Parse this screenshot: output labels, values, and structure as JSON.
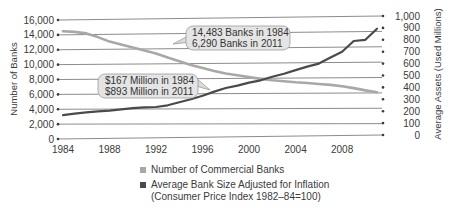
{
  "chart_data": {
    "type": "line",
    "title": "",
    "xlabel": "",
    "ylabel": "Number of Banks",
    "y2label": "Average Assets (Used Millions)",
    "x_ticks": [
      "1984",
      "1988",
      "1992",
      "1996",
      "2000",
      "2004",
      "2008"
    ],
    "y_ticks": [
      "0",
      "2,000",
      "4,000",
      "6,000",
      "8,000",
      "10,000",
      "12,000",
      "14,000",
      "16,000"
    ],
    "y2_ticks": [
      "0",
      "100",
      "200",
      "300",
      "400",
      "500",
      "600",
      "700",
      "800",
      "900",
      "1,000"
    ],
    "ylim": [
      0,
      16000
    ],
    "y2lim": [
      0,
      1000
    ],
    "xlim": [
      1984,
      2011
    ],
    "grid": true,
    "legend_position": "bottom",
    "x": [
      1984,
      1985,
      1986,
      1987,
      1988,
      1989,
      1990,
      1991,
      1992,
      1993,
      1994,
      1995,
      1996,
      1997,
      1998,
      1999,
      2000,
      2001,
      2002,
      2003,
      2004,
      2005,
      2006,
      2007,
      2008,
      2009,
      2010,
      2011
    ],
    "series": [
      {
        "name": "Number of Commercial Banks",
        "axis": "left",
        "color": "#a8a8a8",
        "values": [
          14483,
          14400,
          14200,
          13700,
          13100,
          12700,
          12300,
          11900,
          11500,
          10950,
          10450,
          9950,
          9550,
          9150,
          8800,
          8580,
          8320,
          8080,
          7890,
          7770,
          7630,
          7530,
          7400,
          7280,
          7090,
          6840,
          6530,
          6290
        ]
      },
      {
        "name": "Average Bank Size Adjusted for Inflation (Consumer Price Index 1982-84=100)",
        "axis": "right",
        "color": "#4a4a4a",
        "values": [
          167,
          180,
          190,
          198,
          205,
          215,
          225,
          232,
          235,
          250,
          275,
          300,
          330,
          365,
          395,
          415,
          440,
          460,
          490,
          515,
          545,
          575,
          600,
          650,
          700,
          790,
          800,
          893
        ]
      }
    ],
    "annotations": [
      {
        "lines": [
          "14,483 Banks in 1984",
          "6,290 Banks in 2011"
        ],
        "target_series": "Number of Commercial Banks"
      },
      {
        "lines": [
          "$167 Million in 1984",
          "$893 Million in 2011"
        ],
        "target_series": "Average Bank Size Adjusted for Inflation"
      }
    ]
  },
  "legend": {
    "items": [
      {
        "label": "Number of Commercial Banks",
        "color": "#a8a8a8"
      },
      {
        "label_line1": "Average Bank Size Adjusted for Inflation",
        "label_line2": "(Consumer Price Index 1982–84=100)",
        "color": "#4a4a4a"
      }
    ]
  },
  "callouts": {
    "banks": {
      "line1": "14,483 Banks in 1984",
      "line2": "6,290 Banks in 2011"
    },
    "size": {
      "line1": "$167 Million in 1984",
      "line2": "$893 Million in 2011"
    }
  },
  "axes": {
    "left_title": "Number of Banks",
    "right_title": "Average Assets (Used Millions)"
  }
}
